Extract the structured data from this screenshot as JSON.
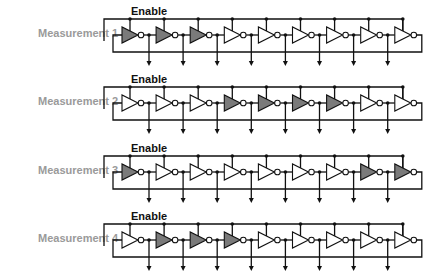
{
  "diagram": {
    "type": "ring-oscillator-measurement-configurations",
    "stage_count": 9,
    "colors": {
      "active_stage_fill": "#7a7a7a",
      "inactive_stage_fill": "#ffffff",
      "wire": "#111111",
      "label": "#9a9a9a"
    },
    "rows": [
      {
        "label": "Measurement 1",
        "enable_label": "Enable",
        "active_stages": [
          1,
          1,
          1,
          0,
          0,
          0,
          0,
          0,
          0
        ]
      },
      {
        "label": "Measurement 2",
        "enable_label": "Enable",
        "active_stages": [
          0,
          0,
          0,
          1,
          1,
          1,
          1,
          0,
          0
        ]
      },
      {
        "label": "Measurement 3",
        "enable_label": "Enable",
        "active_stages": [
          1,
          0,
          0,
          0,
          0,
          0,
          0,
          1,
          1
        ]
      },
      {
        "label": "Measurement 4",
        "enable_label": "Enable",
        "active_stages": [
          0,
          1,
          1,
          1,
          0,
          0,
          0,
          0,
          0
        ]
      }
    ]
  }
}
